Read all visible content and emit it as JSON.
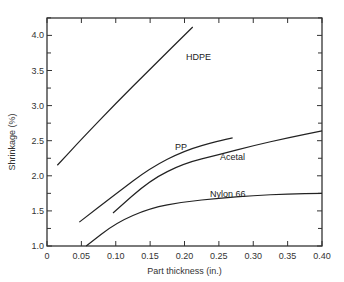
{
  "chart_data": {
    "type": "line",
    "title": "",
    "xlabel": "Part thickness (in.)",
    "ylabel": "Shrinkage (%)",
    "xlim": [
      0,
      0.4
    ],
    "ylim": [
      1.0,
      4.25
    ],
    "xticks": [
      "0",
      "0.05",
      "0.10",
      "0.15",
      "0.20",
      "0.25",
      "0.30",
      "0.35",
      "0.40"
    ],
    "yticks": [
      "1.0",
      "1.5",
      "2.0",
      "2.5",
      "3.0",
      "3.5",
      "4.0"
    ],
    "grid": false,
    "legend": "inline labels",
    "series": [
      {
        "name": "HDPE",
        "x": [
          0.015,
          0.05,
          0.1,
          0.15,
          0.212
        ],
        "y": [
          2.15,
          2.52,
          3.03,
          3.52,
          4.12
        ]
      },
      {
        "name": "PP",
        "x": [
          0.047,
          0.1,
          0.15,
          0.2,
          0.25,
          0.27
        ],
        "y": [
          1.34,
          1.74,
          2.11,
          2.36,
          2.5,
          2.54
        ]
      },
      {
        "name": "Acetal",
        "x": [
          0.096,
          0.15,
          0.2,
          0.25,
          0.3,
          0.35,
          0.4
        ],
        "y": [
          1.47,
          1.94,
          2.18,
          2.3,
          2.43,
          2.54,
          2.64
        ]
      },
      {
        "name": "Nylon 66",
        "x": [
          0.057,
          0.1,
          0.15,
          0.2,
          0.25,
          0.3,
          0.35,
          0.4
        ],
        "y": [
          1.0,
          1.33,
          1.54,
          1.63,
          1.68,
          1.72,
          1.74,
          1.75
        ]
      }
    ]
  }
}
